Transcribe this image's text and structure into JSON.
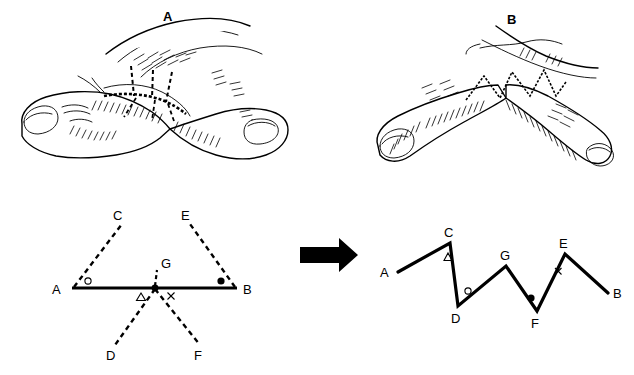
{
  "figure": {
    "background_color": "#ffffff",
    "ink_color": "#000000",
    "width": 634,
    "height": 375
  },
  "panels": [
    {
      "id": "A",
      "label": "A",
      "caption": "Contracted web space with planned multiple Z-plasty incision lines (dashed)",
      "label_x": 163,
      "label_y": 10
    },
    {
      "id": "B",
      "label": "B",
      "caption": "Result after Z-plasty transposition showing zigzag suture line",
      "label_x": 507,
      "label_y": 13
    }
  ],
  "arrow": {
    "name": "transform-arrow",
    "direction": "right",
    "x": 300,
    "y": 244,
    "width": 58,
    "height": 22,
    "color": "#000000"
  },
  "diagram_before": {
    "name": "schematic-before",
    "description": "Straight contracture line A-B with two dashed limbs above (C, E) and two dashed limbs below (D, F) meeting at central point G",
    "points": [
      {
        "id": "A",
        "label": "A",
        "x": 72,
        "y": 288,
        "label_x": 57,
        "label_y": 293,
        "style": "solid-endpoint"
      },
      {
        "id": "B",
        "label": "B",
        "x": 237,
        "y": 288,
        "label_x": 243,
        "label_y": 293,
        "style": "solid-endpoint"
      },
      {
        "id": "C",
        "label": "C",
        "x": 122,
        "y": 224,
        "label_x": 114,
        "label_y": 219,
        "style": "dashed-endpoint"
      },
      {
        "id": "E",
        "label": "E",
        "x": 190,
        "y": 224,
        "label_x": 182,
        "label_y": 219,
        "style": "dashed-endpoint"
      },
      {
        "id": "G",
        "label": "G",
        "x": 155,
        "y": 288,
        "label_x": 162,
        "label_y": 272,
        "style": "intersection"
      },
      {
        "id": "D",
        "label": "D",
        "x": 115,
        "y": 345,
        "label_x": 108,
        "label_y": 358,
        "style": "dashed-endpoint"
      },
      {
        "id": "F",
        "label": "F",
        "x": 200,
        "y": 345,
        "label_x": 195,
        "label_y": 358,
        "style": "dashed-endpoint"
      }
    ],
    "solid_segments": [
      [
        "A",
        "B"
      ]
    ],
    "dashed_segments": [
      [
        "A",
        "C"
      ],
      [
        "B",
        "E"
      ],
      [
        "G",
        "D"
      ],
      [
        "G",
        "F"
      ],
      [
        "G",
        "Gtop"
      ]
    ],
    "markers": [
      {
        "glyph": "circle-open",
        "name": "marker-circle-open",
        "x": 87,
        "y": 281,
        "near": "A"
      },
      {
        "glyph": "circle-filled",
        "name": "marker-circle-filled",
        "x": 221,
        "y": 281,
        "near": "B"
      },
      {
        "glyph": "triangle-open",
        "name": "marker-triangle-open",
        "x": 141,
        "y": 297,
        "near": "G-left"
      },
      {
        "glyph": "cross-x",
        "name": "marker-cross-x",
        "x": 171,
        "y": 296,
        "near": "G-right"
      }
    ]
  },
  "diagram_after": {
    "name": "schematic-after",
    "description": "Transposed zigzag line running A-C-D-G-F-E-B",
    "path_order": [
      "A",
      "C",
      "D",
      "G",
      "F",
      "E",
      "B"
    ],
    "points": [
      {
        "id": "A",
        "label": "A",
        "x": 398,
        "y": 272,
        "label_x": 383,
        "label_y": 276,
        "kind": "end"
      },
      {
        "id": "C",
        "label": "C",
        "x": 450,
        "y": 243,
        "label_x": 445,
        "label_y": 235,
        "kind": "peak"
      },
      {
        "id": "D",
        "label": "D",
        "x": 458,
        "y": 306,
        "label_x": 451,
        "label_y": 321,
        "kind": "valley"
      },
      {
        "id": "G",
        "label": "G",
        "x": 506,
        "y": 266,
        "label_x": 501,
        "label_y": 258,
        "kind": "peak"
      },
      {
        "id": "F",
        "label": "F",
        "x": 537,
        "y": 311,
        "label_x": 532,
        "label_y": 326,
        "kind": "valley"
      },
      {
        "id": "E",
        "label": "E",
        "x": 565,
        "y": 254,
        "label_x": 560,
        "label_y": 246,
        "kind": "peak"
      },
      {
        "id": "B",
        "label": "B",
        "x": 608,
        "y": 293,
        "label_x": 614,
        "label_y": 297,
        "kind": "end"
      }
    ],
    "markers": [
      {
        "glyph": "triangle-open",
        "name": "marker-triangle-open",
        "x": 448,
        "y": 257,
        "near": "C"
      },
      {
        "glyph": "circle-open",
        "name": "marker-circle-open",
        "x": 467,
        "y": 292,
        "near": "D"
      },
      {
        "glyph": "circle-filled",
        "name": "marker-circle-filled",
        "x": 531,
        "y": 299,
        "near": "F"
      },
      {
        "glyph": "cross-x",
        "name": "marker-cross-x",
        "x": 558,
        "y": 271,
        "near": "E"
      }
    ]
  },
  "legend_glyphs": {
    "circle_open": "○",
    "circle_filled": "●",
    "triangle_open": "△",
    "cross": "×"
  }
}
